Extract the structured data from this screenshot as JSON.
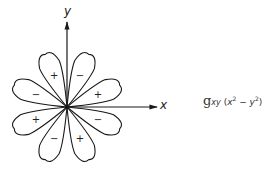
{
  "diagram": {
    "center": [
      67,
      107
    ],
    "lobe_length": 56,
    "lobe_half_width": 8.5,
    "lobes": [
      {
        "angle_deg": 22.5,
        "sign": "+"
      },
      {
        "angle_deg": 67.5,
        "sign": "−"
      },
      {
        "angle_deg": 112.5,
        "sign": "+"
      },
      {
        "angle_deg": 157.5,
        "sign": "−"
      },
      {
        "angle_deg": 202.5,
        "sign": "+"
      },
      {
        "angle_deg": 247.5,
        "sign": "−"
      },
      {
        "angle_deg": 292.5,
        "sign": "+"
      },
      {
        "angle_deg": 337.5,
        "sign": "−"
      }
    ],
    "axes": {
      "x_label": "x",
      "y_label": "y"
    },
    "caption": {
      "symbol": "g",
      "subscript": "xy",
      "expr_open": " (",
      "x": "x",
      "exp1": "2",
      "minus": " − ",
      "y": "y",
      "exp2": "2",
      "expr_close": ")"
    },
    "colors": {
      "stroke": "#1a1a1a",
      "background": "#ffffff"
    }
  }
}
